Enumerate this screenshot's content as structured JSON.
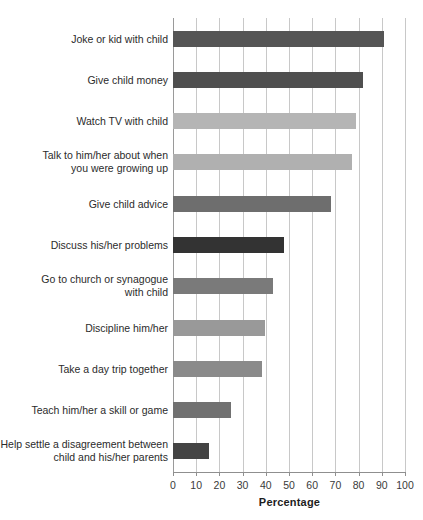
{
  "chart_data": {
    "type": "bar",
    "orientation": "horizontal",
    "title": "",
    "xlabel": "Percentage",
    "ylabel": "",
    "xlim": [
      0,
      100
    ],
    "xticks": [
      0,
      10,
      20,
      30,
      40,
      50,
      60,
      70,
      80,
      90,
      100
    ],
    "xtick_labels": [
      "0",
      "10",
      "20",
      "30",
      "40",
      "50",
      "60",
      "70",
      "80",
      "90",
      "100"
    ],
    "grid": "vertical",
    "legend": "none",
    "categories": [
      "Joke or kid with child",
      "Give child money",
      "Watch TV with child",
      "Talk to him/her about when\nyou were growing up",
      "Give child advice",
      "Discuss his/her problems",
      "Go to church or synagogue\nwith child",
      "Discipline him/her",
      "Take a day trip together",
      "Teach him/her a skill or game",
      "Help settle a disagreement between\nchild and his/her parents"
    ],
    "values": [
      91,
      82,
      79,
      77,
      68,
      48,
      43,
      39.5,
      38.5,
      25,
      15.5
    ],
    "bar_colors": [
      "#555555",
      "#4f4f4f",
      "#b5b5b5",
      "#b0b0b0",
      "#6e6e6e",
      "#333333",
      "#7a7a7a",
      "#999999",
      "#8a8a8a",
      "#717171",
      "#444444"
    ]
  },
  "style": {
    "background": "#ffffff",
    "gridline_color": "#c8c8c8",
    "axis_color": "#8f8f8f",
    "text_color": "#2b2b2b"
  }
}
